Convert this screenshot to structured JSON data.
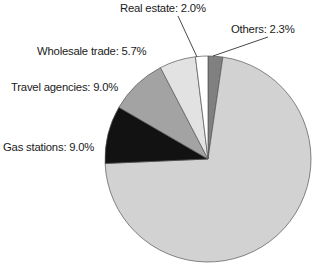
{
  "chart_data": {
    "type": "pie",
    "title": "",
    "subtitle": "",
    "xlabel": "",
    "ylabel": "",
    "legend_position": "none",
    "grid": false,
    "labels_shown": true,
    "background_color": "#ffffff",
    "center": {
      "x": 208,
      "y": 159
    },
    "radius": 103,
    "start_angle_deg": 0,
    "direction": "clockwise",
    "categories": [
      "Others",
      "Unlabeled (largest share)",
      "Real estate",
      "Wholesale trade",
      "Travel agencies",
      "Gas stations"
    ],
    "values": [
      2.3,
      72.0,
      2.0,
      5.7,
      9.0,
      9.0
    ],
    "slices": [
      {
        "name": "Others",
        "label": "Others: 2.3%",
        "value": 2.3,
        "color": "#808080",
        "start_deg": 0,
        "end_deg": 8.3,
        "has_leader_line": true
      },
      {
        "name": "Unlabeled",
        "label": "",
        "value": 72.0,
        "color": "#d2d2d2",
        "start_deg": 8.3,
        "end_deg": 267.5,
        "has_leader_line": false
      },
      {
        "name": "Gas stations",
        "label": "Gas stations: 9.0%",
        "value": 9.0,
        "color": "#121212",
        "start_deg": 267.5,
        "end_deg": 300.1,
        "has_leader_line": false
      },
      {
        "name": "Travel agencies",
        "label": "Travel agencies: 9.0%",
        "value": 9.0,
        "color": "#a3a3a3",
        "start_deg": 300.1,
        "end_deg": 332.5,
        "has_leader_line": false
      },
      {
        "name": "Wholesale trade",
        "label": "Wholesale trade: 5.7%",
        "value": 5.7,
        "color": "#e2e2e2",
        "start_deg": 332.5,
        "end_deg": 353.0,
        "has_leader_line": false
      },
      {
        "name": "Real estate",
        "label": "Real estate: 2.0%",
        "value": 2.0,
        "color": "#ffffff",
        "start_deg": 353.0,
        "end_deg": 360.0,
        "has_leader_line": true
      }
    ],
    "stroke_color": "#555555",
    "stroke_width": 0.7
  },
  "labels": {
    "real_estate": "Real estate: 2.0%",
    "others": "Others: 2.3%",
    "wholesale_trade": "Wholesale trade: 5.7%",
    "travel_agencies": "Travel agencies: 9.0%",
    "gas_stations": "Gas stations: 9.0%"
  },
  "colors": {
    "others_slice": "#808080",
    "main_slice": "#d2d2d2",
    "gas_stations_slice": "#121212",
    "travel_agencies_slice": "#a3a3a3",
    "wholesale_trade_slice": "#e2e2e2",
    "real_estate_slice": "#ffffff",
    "outline": "#555555",
    "text": "#1a1a1a",
    "background": "#ffffff"
  }
}
